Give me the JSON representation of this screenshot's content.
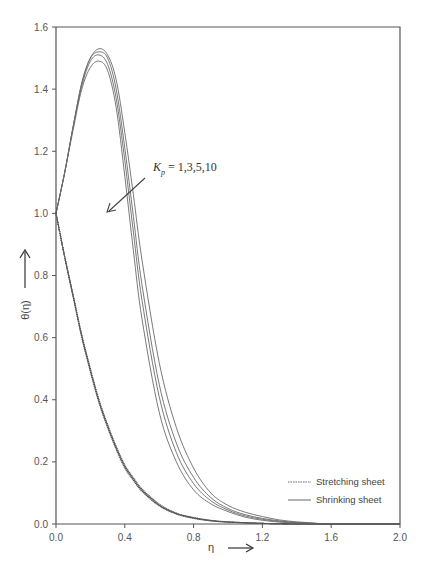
{
  "chart_data": {
    "type": "line",
    "title": "",
    "xlabel": "η",
    "ylabel": "θ(η)",
    "xlim": [
      0.0,
      2.0
    ],
    "ylim": [
      0.0,
      1.6
    ],
    "xticks": [
      0.0,
      0.4,
      0.8,
      1.2,
      1.6,
      2.0
    ],
    "xtick_labels": [
      "0.0",
      "0.4",
      "0.8",
      "1.2",
      "1.6",
      "2.0"
    ],
    "yticks": [
      0.0,
      0.2,
      0.4,
      0.6,
      0.8,
      1.0,
      1.2,
      1.4,
      1.6
    ],
    "ytick_labels": [
      "0.0",
      "0.2",
      "0.4",
      "0.6",
      "0.8",
      "1.0",
      "1.2",
      "1.4",
      "1.6"
    ],
    "grid": false,
    "legend_position": "lower right",
    "legend": [
      {
        "label": "Stretching sheet",
        "style": "dotted"
      },
      {
        "label": "Shrinking sheet",
        "style": "solid"
      }
    ],
    "annotation": {
      "text_main": "K",
      "text_sub": "p",
      "text_rest": " = 1,3,5,10",
      "position": [
        0.58,
        1.1
      ],
      "arrow_from": [
        0.52,
        1.07
      ],
      "arrow_to": [
        0.3,
        0.99
      ]
    },
    "series": [
      {
        "name": "Stretching sheet, Kp=1",
        "style": "dotted",
        "x": [
          0.0,
          0.05,
          0.1,
          0.15,
          0.2,
          0.25,
          0.3,
          0.35,
          0.4,
          0.45,
          0.5,
          0.6,
          0.7,
          0.8,
          0.9,
          1.0,
          1.2,
          1.4,
          1.6,
          2.0
        ],
        "y": [
          1.0,
          0.86,
          0.73,
          0.6,
          0.49,
          0.39,
          0.31,
          0.24,
          0.18,
          0.14,
          0.105,
          0.058,
          0.032,
          0.018,
          0.01,
          0.006,
          0.002,
          0.0,
          0.0,
          0.0
        ]
      },
      {
        "name": "Stretching sheet, Kp=3",
        "style": "dotted",
        "x": [
          0.0,
          0.05,
          0.1,
          0.15,
          0.2,
          0.25,
          0.3,
          0.35,
          0.4,
          0.45,
          0.5,
          0.6,
          0.7,
          0.8,
          0.9,
          1.0,
          1.2,
          1.4,
          1.6,
          2.0
        ],
        "y": [
          1.0,
          0.861,
          0.732,
          0.603,
          0.494,
          0.394,
          0.314,
          0.244,
          0.184,
          0.143,
          0.108,
          0.06,
          0.033,
          0.019,
          0.011,
          0.006,
          0.002,
          0.0,
          0.0,
          0.0
        ]
      },
      {
        "name": "Stretching sheet, Kp=5",
        "style": "dotted",
        "x": [
          0.0,
          0.05,
          0.1,
          0.15,
          0.2,
          0.25,
          0.3,
          0.35,
          0.4,
          0.45,
          0.5,
          0.6,
          0.7,
          0.8,
          0.9,
          1.0,
          1.2,
          1.4,
          1.6,
          2.0
        ],
        "y": [
          1.0,
          0.862,
          0.734,
          0.606,
          0.497,
          0.397,
          0.317,
          0.247,
          0.187,
          0.146,
          0.11,
          0.062,
          0.034,
          0.02,
          0.011,
          0.007,
          0.002,
          0.0,
          0.0,
          0.0
        ]
      },
      {
        "name": "Stretching sheet, Kp=10",
        "style": "dotted",
        "x": [
          0.0,
          0.05,
          0.1,
          0.15,
          0.2,
          0.25,
          0.3,
          0.35,
          0.4,
          0.45,
          0.5,
          0.6,
          0.7,
          0.8,
          0.9,
          1.0,
          1.2,
          1.4,
          1.6,
          2.0
        ],
        "y": [
          1.0,
          0.863,
          0.736,
          0.609,
          0.5,
          0.4,
          0.32,
          0.25,
          0.19,
          0.149,
          0.113,
          0.064,
          0.035,
          0.021,
          0.012,
          0.007,
          0.002,
          0.0,
          0.0,
          0.0
        ]
      },
      {
        "name": "Shrinking sheet, Kp=1",
        "style": "solid",
        "x": [
          0.0,
          0.05,
          0.1,
          0.15,
          0.2,
          0.25,
          0.3,
          0.35,
          0.4,
          0.45,
          0.5,
          0.6,
          0.7,
          0.8,
          0.9,
          1.0,
          1.1,
          1.2,
          1.3,
          1.4,
          1.5,
          1.6,
          2.0
        ],
        "y": [
          1.0,
          1.13,
          1.27,
          1.4,
          1.47,
          1.49,
          1.46,
          1.34,
          1.12,
          0.88,
          0.66,
          0.36,
          0.2,
          0.11,
          0.065,
          0.04,
          0.022,
          0.012,
          0.006,
          0.003,
          0.001,
          0.0,
          0.0
        ]
      },
      {
        "name": "Shrinking sheet, Kp=3",
        "style": "solid",
        "x": [
          0.0,
          0.05,
          0.1,
          0.15,
          0.2,
          0.25,
          0.3,
          0.35,
          0.4,
          0.45,
          0.5,
          0.6,
          0.7,
          0.8,
          0.9,
          1.0,
          1.1,
          1.2,
          1.3,
          1.4,
          1.5,
          1.6,
          2.0
        ],
        "y": [
          1.0,
          1.13,
          1.28,
          1.41,
          1.49,
          1.51,
          1.48,
          1.37,
          1.17,
          0.94,
          0.72,
          0.41,
          0.23,
          0.13,
          0.075,
          0.045,
          0.026,
          0.015,
          0.008,
          0.004,
          0.002,
          0.0,
          0.0
        ]
      },
      {
        "name": "Shrinking sheet, Kp=5",
        "style": "solid",
        "x": [
          0.0,
          0.05,
          0.1,
          0.15,
          0.2,
          0.25,
          0.3,
          0.35,
          0.4,
          0.45,
          0.5,
          0.6,
          0.7,
          0.8,
          0.9,
          1.0,
          1.1,
          1.2,
          1.3,
          1.4,
          1.5,
          1.6,
          2.0
        ],
        "y": [
          1.0,
          1.13,
          1.28,
          1.42,
          1.5,
          1.52,
          1.5,
          1.4,
          1.21,
          0.99,
          0.77,
          0.45,
          0.26,
          0.15,
          0.085,
          0.05,
          0.03,
          0.018,
          0.01,
          0.005,
          0.002,
          0.0,
          0.0
        ]
      },
      {
        "name": "Shrinking sheet, Kp=10",
        "style": "solid",
        "x": [
          0.0,
          0.05,
          0.1,
          0.15,
          0.2,
          0.25,
          0.3,
          0.35,
          0.4,
          0.45,
          0.5,
          0.6,
          0.7,
          0.8,
          0.9,
          1.0,
          1.1,
          1.2,
          1.3,
          1.4,
          1.5,
          1.6,
          2.0
        ],
        "y": [
          1.0,
          1.13,
          1.28,
          1.42,
          1.5,
          1.53,
          1.51,
          1.43,
          1.26,
          1.06,
          0.85,
          0.52,
          0.31,
          0.18,
          0.1,
          0.06,
          0.038,
          0.024,
          0.013,
          0.007,
          0.003,
          0.0,
          0.0
        ]
      }
    ]
  }
}
